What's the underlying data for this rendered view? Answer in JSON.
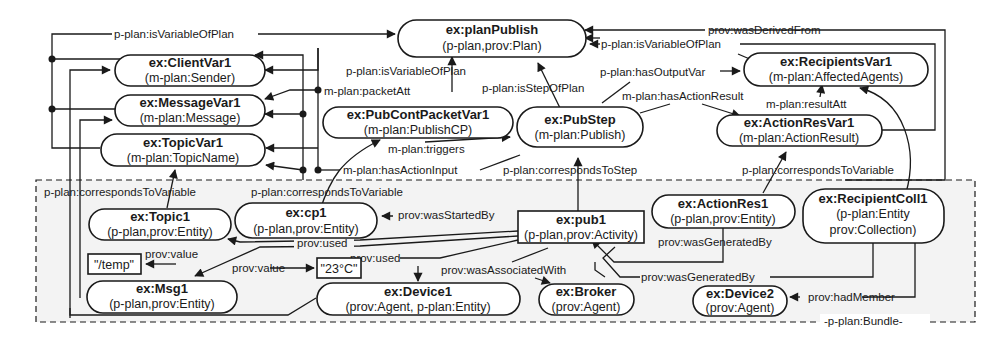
{
  "bundle": {
    "label": "-p-plan:Bundle-"
  },
  "nodes": {
    "planPublish": {
      "title": "ex:planPublish",
      "sub": "(p-plan,prov:Plan)"
    },
    "clientVar": {
      "title": "ex:ClientVar1",
      "sub": "(m-plan:Sender)"
    },
    "messageVar": {
      "title": "ex:MessageVar1",
      "sub": "(m-plan:Message)"
    },
    "topicVar": {
      "title": "ex:TopicVar1",
      "sub": "(m-plan:TopicName)"
    },
    "pubContPacketVar": {
      "title": "ex:PubContPacketVar1",
      "sub": "(m-plan:PublishCP)"
    },
    "pubStep": {
      "title": "ex:PubStep",
      "sub": "(m-plan:Publish)"
    },
    "recipientsVar": {
      "title": "ex:RecipientsVar1",
      "sub": "(m-plan:AffectedAgents)"
    },
    "actionResVar": {
      "title": "ex:ActionResVar1",
      "sub": "(m-plan:ActionResult)"
    },
    "topic1": {
      "title": "ex:Topic1",
      "sub": "(p-plan,prov:Entity)"
    },
    "cp1": {
      "title": "ex:cp1",
      "sub": "(p-plan,prov:Entity)"
    },
    "pub1": {
      "title": "ex:pub1",
      "sub": "(p-plan,prov:Activity)"
    },
    "actionRes1": {
      "title": "ex:ActionRes1",
      "sub": "(p-plan,prov:Entity)"
    },
    "recipientColl1": {
      "title": "ex:RecipientColl1",
      "sub": "(p-plan:Entity",
      "sub2": "prov:Collection)"
    },
    "temp": {
      "title": "\"/temp\""
    },
    "temp23": {
      "title": "\"23°C\""
    },
    "msg1": {
      "title": "ex:Msg1",
      "sub": "(p-plan,prov:Entity)"
    },
    "device1": {
      "title": "ex:Device1",
      "sub": "(prov:Agent, p-plan:Entity)"
    },
    "broker": {
      "title": "ex:Broker",
      "sub": "(prov:Agent)"
    },
    "device2": {
      "title": "ex:Device2",
      "sub": "(prov:Agent)"
    }
  },
  "edges": {
    "isVariableOfPlanTop": "p-plan:isVariableOfPlan",
    "wasDerivedFrom": "prov:wasDerivedFrom",
    "isVariableOfPlanRight": "p-plan:isVariableOfPlan",
    "isVariableOfPlanMid": "p-plan:isVariableOfPlan",
    "packetAtt": "m-plan:packetAtt",
    "isStepOfPlan": "p-plan:isStepOfPlan",
    "hasOutputVar": "p-plan:hasOutputVar",
    "hasActionResult": "m-plan:hasActionResult",
    "resultAtt": "m-plan:resultAtt",
    "triggers": "m-plan:triggers",
    "hasActionInput": "m-plan:hasActionInput",
    "correspondsToStep": "p-plan:correspondsToStep",
    "correspondsToVariableRight": "p-plan:correspondsToVariable",
    "correspondsToVariableLeft": "p-plan:correspondsToVariable",
    "correspondsToVariableCp1": "p-plan:correspondsToVariable",
    "wasStartedBy": "prov:wasStartedBy",
    "used1": "prov:used",
    "used2": "prov:used",
    "value1": "prov:value",
    "value2": "prov:value",
    "wasAssociatedWith": "prov:wasAssociatedWith",
    "wasGeneratedBy1": "prov:wasGeneratedBy",
    "wasGeneratedBy2": "prov:wasGeneratedBy",
    "hadMember": "prov:hadMember"
  }
}
